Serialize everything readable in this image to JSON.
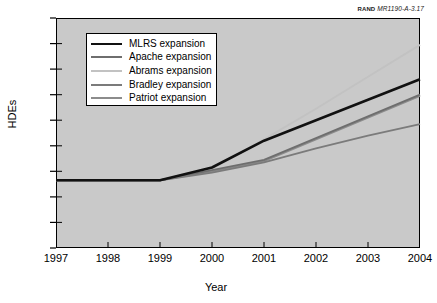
{
  "credit": {
    "org": "RAND",
    "doc_id": "MR1190-A-3.17"
  },
  "axes": {
    "ylabel": "HDEs",
    "xlabel": "Year",
    "yticks": [
      "90",
      "80",
      "70",
      "60",
      "50",
      "40",
      "30",
      "20",
      "10",
      "0"
    ],
    "xticks": [
      "1997",
      "1998",
      "1999",
      "2000",
      "2001",
      "2002",
      "2003",
      "2004"
    ]
  },
  "legend": {
    "items": [
      {
        "label": "MLRS expansion",
        "color": "#111111",
        "width": 2.6
      },
      {
        "label": "Apache expansion",
        "color": "#6e6e6e",
        "width": 1.9
      },
      {
        "label": "Abrams expansion",
        "color": "#c2c2c2",
        "width": 1.9
      },
      {
        "label": "Bradley expansion",
        "color": "#7b7b7b",
        "width": 1.9
      },
      {
        "label": "Patriot expansion",
        "color": "#8c8c8c",
        "width": 1.9
      }
    ]
  },
  "chart_data": {
    "type": "line",
    "title": "",
    "xlabel": "Year",
    "ylabel": "HDEs",
    "x": [
      1997,
      1998,
      1999,
      2000,
      2001,
      2002,
      2003,
      2004
    ],
    "xlim": [
      1997,
      2004
    ],
    "ylim": [
      0,
      90
    ],
    "grid": false,
    "legend_position": "upper-left-inside",
    "plot_background": "#c9c9c9",
    "series": [
      {
        "name": "MLRS expansion",
        "color": "#111111",
        "width": 2.6,
        "values": [
          26.5,
          26.5,
          26.5,
          31.5,
          42.0,
          50.0,
          58.0,
          66.0
        ]
      },
      {
        "name": "Apache expansion",
        "color": "#6e6e6e",
        "width": 1.9,
        "values": [
          26.5,
          26.5,
          26.5,
          30.5,
          34.5,
          43.0,
          51.5,
          60.0
        ]
      },
      {
        "name": "Abrams expansion",
        "color": "#c2c2c2",
        "width": 1.9,
        "values": [
          26.5,
          26.5,
          26.5,
          31.0,
          42.5,
          54.5,
          67.0,
          79.5
        ]
      },
      {
        "name": "Bradley expansion",
        "color": "#7b7b7b",
        "width": 1.9,
        "values": [
          26.5,
          26.5,
          26.5,
          29.5,
          33.5,
          39.0,
          44.0,
          48.5
        ]
      },
      {
        "name": "Patriot expansion",
        "color": "#8c8c8c",
        "width": 1.9,
        "values": [
          26.5,
          26.5,
          26.5,
          30.0,
          34.0,
          42.5,
          51.0,
          59.5
        ]
      }
    ]
  }
}
